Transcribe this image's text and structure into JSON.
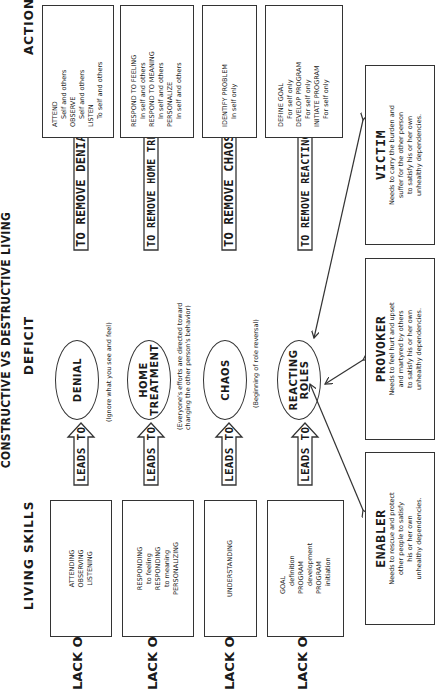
{
  "title": "CONSTRUCTIVE VS DESTRUCTIVE LIVING",
  "columns": {
    "living_skills": "LIVING SKILLS",
    "deficit": "DEFICIT",
    "action": "ACTION"
  },
  "rows": [
    {
      "lack_label": "LACK OF",
      "skills": [
        "ATTENDING",
        "OBSERVING",
        "LISTENING"
      ],
      "leads_to": "LEADS TO",
      "deficit": [
        "DENIAL"
      ],
      "note": [
        "(Ignore what you see and feel)"
      ],
      "remove": "TO REMOVE DENIAL",
      "action": [
        {
          "text": "ATTEND",
          "indent": false
        },
        {
          "text": "Self and others",
          "indent": true
        },
        {
          "text": "OBSERVE",
          "indent": false
        },
        {
          "text": "Self and others",
          "indent": true
        },
        {
          "text": "LISTEN",
          "indent": false
        },
        {
          "text": "To self and others",
          "indent": true
        }
      ]
    },
    {
      "lack_label": "LACK OF",
      "skills": [
        "RESPONDING",
        "to feeling",
        "RESPONDING",
        "to meaning",
        "PERSONALIZING"
      ],
      "leads_to": "LEADS TO",
      "deficit": [
        "HOME",
        "TREATMENT"
      ],
      "note": [
        "(Everyone's efforts are directed toward",
        "changing the other person's behavior)"
      ],
      "remove": "TO REMOVE HOME TREATMENT",
      "action": [
        {
          "text": "RESPOND TO FEELING",
          "indent": false
        },
        {
          "text": "In self and others",
          "indent": true
        },
        {
          "text": "RESPOND TO MEANING",
          "indent": false
        },
        {
          "text": "In self and others",
          "indent": true
        },
        {
          "text": "PERSONALIZE",
          "indent": false
        },
        {
          "text": "In self and others",
          "indent": true
        }
      ]
    },
    {
      "lack_label": "LACK OF",
      "skills": [
        "UNDERSTANDING"
      ],
      "leads_to": "LEADS TO",
      "deficit": [
        "CHAOS"
      ],
      "note": [
        "(Beginning of role reversal)"
      ],
      "remove": "TO REMOVE CHAOS",
      "action": [
        {
          "text": "IDENTIFY PROBLEM",
          "indent": false
        },
        {
          "text": "In self only",
          "indent": true
        }
      ]
    },
    {
      "lack_label": "LACK OF",
      "skills": [
        "GOAL",
        "definition",
        "PROGRAM",
        "development",
        "PROGRAM",
        "initiation"
      ],
      "leads_to": "LEADS TO",
      "deficit": [
        "REACTING",
        "ROLES"
      ],
      "note": [],
      "remove": "TO REMOVE REACTING ROLES",
      "action": [
        {
          "text": "DEFINE GOAL",
          "indent": false
        },
        {
          "text": "For self only",
          "indent": true
        },
        {
          "text": "DEVELOP PROGRAM",
          "indent": false
        },
        {
          "text": "For self only",
          "indent": true
        },
        {
          "text": "INITIATE PROGRAM",
          "indent": false
        },
        {
          "text": "For self only",
          "indent": true
        }
      ]
    }
  ],
  "roles": [
    {
      "name": "ENABLER",
      "description": [
        "Needs to rescue and protect",
        "other people to satisfy",
        "his or her own",
        "unhealthy dependencies."
      ]
    },
    {
      "name": "PROVOKER",
      "description": [
        "Needs to feel hurt and upset",
        "and martyred by others",
        "to satisfy his or her own",
        "unhealthy dependencies."
      ]
    },
    {
      "name": "VICTIM",
      "description": [
        "Needs to carry the burden and",
        "suffer for the other person",
        "to satisfy his or her own",
        "unhealthy dependencies."
      ]
    }
  ],
  "colors": {
    "ink": "#1a1a1a",
    "line": "#333333",
    "background": "#ffffff"
  }
}
